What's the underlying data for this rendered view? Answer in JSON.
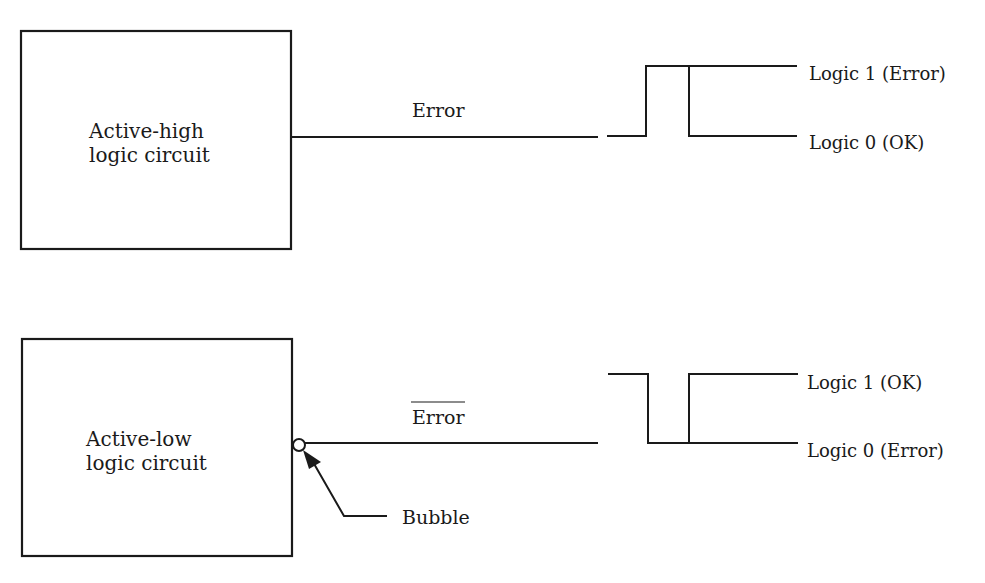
{
  "diagram": {
    "type": "logic-level-comparison",
    "top": {
      "block_label_line1": "Active-high",
      "block_label_line2": "logic circuit",
      "signal_name": "Error",
      "signal_overline": false,
      "level_high_label": "Logic 1 (Error)",
      "level_low_label": "Logic 0 (OK)",
      "pulse": "positive"
    },
    "bottom": {
      "block_label_line1": "Active-low",
      "block_label_line2": "logic circuit",
      "signal_name": "Error",
      "signal_overline": true,
      "level_high_label": "Logic 1 (OK)",
      "level_low_label": "Logic 0 (Error)",
      "pulse": "negative",
      "callout_label": "Bubble"
    },
    "colors": {
      "ink": "#1a1a1a",
      "background": "#ffffff"
    }
  }
}
